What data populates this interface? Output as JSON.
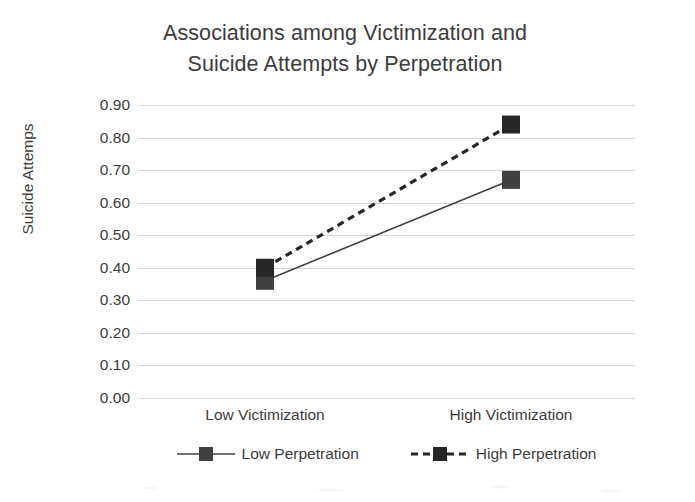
{
  "chart_data": {
    "type": "line",
    "title": "Associations among Victimization and\nSuicide Attempts by Perpetration",
    "xlabel": "",
    "ylabel": "Suicide Attemps",
    "categories": [
      "Low Victimization",
      "High Victimization"
    ],
    "series": [
      {
        "name": "Low Perpetration",
        "values": [
          0.36,
          0.67
        ],
        "style": "solid",
        "marker": "square",
        "color": "#404040"
      },
      {
        "name": "High Perpetration",
        "values": [
          0.4,
          0.84
        ],
        "style": "dashed",
        "marker": "square",
        "color": "#262626"
      }
    ],
    "ylim": [
      0.0,
      0.9
    ],
    "ytick_step": 0.1,
    "ytick_labels": [
      "0.90",
      "0.80",
      "0.70",
      "0.60",
      "0.50",
      "0.40",
      "0.30",
      "0.20",
      "0.10",
      "0.00"
    ],
    "ytick_values": [
      0.9,
      0.8,
      0.7,
      0.6,
      0.5,
      0.4,
      0.3,
      0.2,
      0.1,
      0.0
    ],
    "grid": true,
    "grid_color": "#d6d6d6",
    "legend": true,
    "legend_position": "bottom",
    "legend_entries": [
      "Low Perpetration",
      "High Perpetration"
    ],
    "background": "#ffffff",
    "text_color": "#3c3c3c"
  }
}
